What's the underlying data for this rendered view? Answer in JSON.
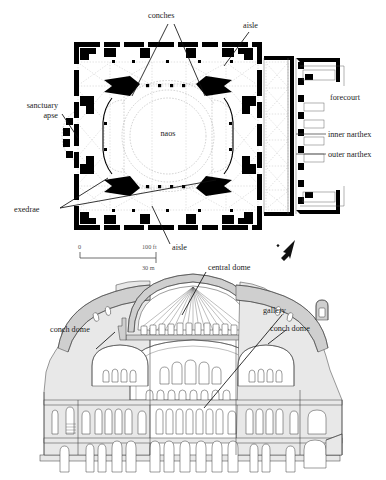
{
  "figure": {
    "background_color": "#ffffff",
    "ink_color": "#000000"
  },
  "plan": {
    "name": "ground-plan",
    "labels": {
      "conches": "conches",
      "aisle_top": "aisle",
      "aisle_bottom": "aisle",
      "sanctuary_apse_line1": "sanctuary",
      "sanctuary_apse_line2": "apse",
      "exedrae": "exedrae",
      "naos": "naos",
      "forecourt": "forecourt",
      "inner_narthex": "inner narthex",
      "outer_narthex": "outer narthex"
    },
    "scale_bar": {
      "zero": "0",
      "feet": "100 ft",
      "meters": "30 m"
    },
    "north_arrow": "north-arrow"
  },
  "section": {
    "name": "longitudinal-section",
    "labels": {
      "central_dome": "central dome",
      "gallery": "gallery",
      "conch_dome_left": "conch dome",
      "conch_dome_right": "conch dome"
    }
  }
}
